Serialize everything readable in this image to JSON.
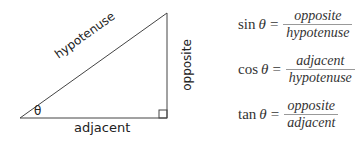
{
  "diagram": {
    "labels": {
      "hypotenuse": "hypotenuse",
      "opposite": "opposite",
      "adjacent": "adjacent",
      "angle": "θ"
    },
    "formulas": [
      {
        "fn": "sin",
        "theta": "θ",
        "eq": "=",
        "numerator": "opposite",
        "denominator": "hypotenuse"
      },
      {
        "fn": "cos",
        "theta": "θ",
        "eq": "=",
        "numerator": "adjacent",
        "denominator": "hypotenuse"
      },
      {
        "fn": "tan",
        "theta": "θ",
        "eq": "=",
        "numerator": "opposite",
        "denominator": "adjacent"
      }
    ]
  }
}
